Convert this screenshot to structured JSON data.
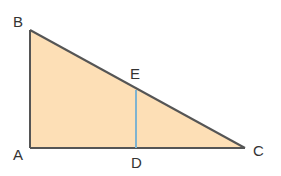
{
  "diagram": {
    "type": "right-triangle",
    "colors": {
      "fill": "#fddfb6",
      "stroke": "#555555",
      "segment": "#7fb3d0",
      "label": "#333333"
    },
    "points": {
      "A": {
        "label": "A",
        "x": 30,
        "y": 148
      },
      "B": {
        "label": "B",
        "x": 30,
        "y": 30
      },
      "C": {
        "label": "C",
        "x": 245,
        "y": 148
      },
      "D": {
        "label": "D",
        "x": 136,
        "y": 148
      },
      "E": {
        "label": "E",
        "x": 136,
        "y": 90
      }
    },
    "segments": [
      "AB",
      "BC",
      "CA",
      "DE"
    ]
  }
}
